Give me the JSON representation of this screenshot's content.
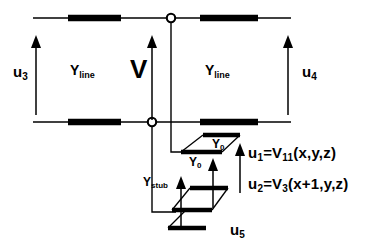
{
  "figure": {
    "type": "circuit-diagram",
    "background_color": "#ffffff",
    "line_color": "#000000"
  },
  "labels": {
    "u3": {
      "base": "u",
      "sub": "3"
    },
    "u4": {
      "base": "u",
      "sub": "4"
    },
    "u5": {
      "base": "u",
      "sub": "5"
    },
    "y_line_left": {
      "base": "Y",
      "sub": "line"
    },
    "y_line_right": {
      "base": "Y",
      "sub": "line"
    },
    "y_stub": {
      "base": "Y",
      "sub": "stub"
    },
    "y0_upper": {
      "base": "Y",
      "sub": "0"
    },
    "y0_lower": {
      "base": "Y",
      "sub": "0"
    },
    "v": "V"
  },
  "equations": [
    {
      "id": "eq-u1",
      "lhs_base": "u",
      "lhs_sub": "1",
      "rel": "=",
      "rhs_base": "V",
      "rhs_sub": "11",
      "args": "(x,y,z)",
      "full_text": "u1 = V11(x,y,z)"
    },
    {
      "id": "eq-u2",
      "lhs_base": "u",
      "lhs_sub": "2",
      "rel": "=",
      "rhs_base": "V",
      "rhs_sub": "3",
      "args": "(x+1,y,z)",
      "full_text": "u2 = V3(x+1,y,z)"
    }
  ],
  "nodes": [
    {
      "name": "top-junction-node",
      "x": 171,
      "y": 18
    },
    {
      "name": "bottom-junction-node",
      "x": 152,
      "y": 122
    }
  ],
  "rails": [
    {
      "name": "top-rail",
      "y": 18,
      "x_start": 33,
      "x_end": 291
    },
    {
      "name": "bottom-rail",
      "y": 122,
      "x_start": 33,
      "x_end": 291
    }
  ],
  "line_segments": [
    {
      "name": "top-left-line-bar",
      "x_start": 68,
      "x_end": 121,
      "y": 18
    },
    {
      "name": "top-right-line-bar",
      "x_start": 200,
      "x_end": 258,
      "y": 18
    },
    {
      "name": "bottom-left-line-bar",
      "x_start": 68,
      "x_end": 121,
      "y": 122
    },
    {
      "name": "bottom-right-line-bar",
      "x_start": 200,
      "x_end": 258,
      "y": 122
    }
  ],
  "arrows": [
    {
      "name": "u3-arrow",
      "x": 36,
      "y_tail": 115,
      "y_head": 38
    },
    {
      "name": "v-arrow",
      "x": 152,
      "y_tail": 120,
      "y_head": 38
    },
    {
      "name": "u4-arrow",
      "x": 288,
      "y_tail": 115,
      "y_head": 38
    },
    {
      "name": "u1-arrow",
      "x": 240,
      "y_tail": 193,
      "y_head": 145
    },
    {
      "name": "u2-arrow",
      "x": 213,
      "y_tail": 208,
      "y_head": 160
    },
    {
      "name": "u5-arrow",
      "x": 181,
      "y_tail": 226,
      "y_head": 178
    }
  ],
  "stubs": [
    {
      "name": "stub-bar-1",
      "x_start": 203,
      "x_end": 240,
      "y": 135
    },
    {
      "name": "stub-bar-2",
      "x_start": 181,
      "x_end": 222,
      "y": 152
    },
    {
      "name": "stub-bar-3",
      "x_start": 190,
      "x_end": 228,
      "y": 188
    },
    {
      "name": "stub-bar-4",
      "x_start": 172,
      "x_end": 212,
      "y": 210
    },
    {
      "name": "stub-bar-5",
      "x_start": 168,
      "x_end": 206,
      "y": 228
    }
  ]
}
